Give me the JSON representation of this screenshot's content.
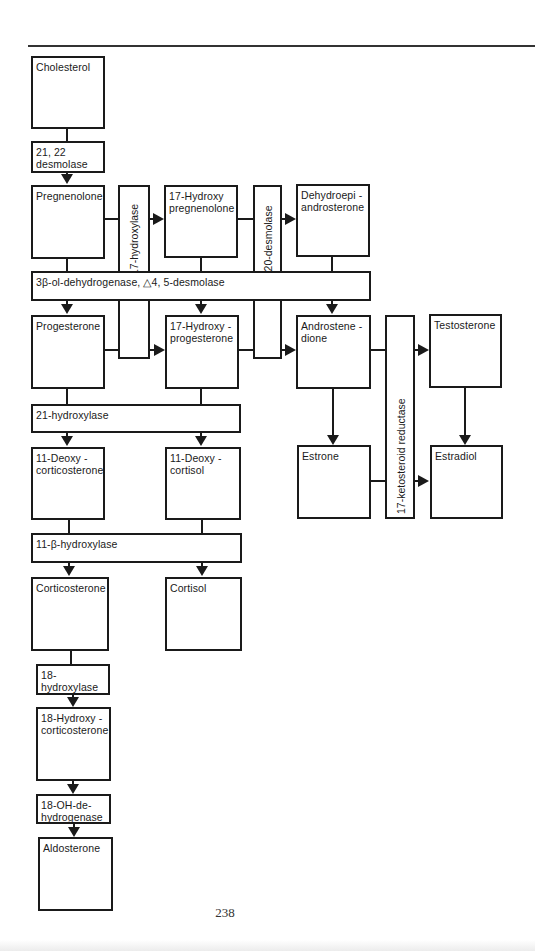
{
  "diagram": {
    "compounds": {
      "cholesterol": "Cholesterol",
      "pregnenolone": "Pregnenolone",
      "hydroxy_pregnenolone": "17-Hydroxy pregnenolone",
      "dhea": "Dehydroepi - androsterone",
      "progesterone": "Progesterone",
      "hydroxy_progesterone": "17-Hydroxy - progesterone",
      "androstenedione": "Androstene - dione",
      "testosterone": "Testosterone",
      "deoxycorticosterone": "11-Deoxy - corticosterone",
      "deoxycortisol": "11-Deoxy - cortisol",
      "estrone": "Estrone",
      "estradiol": "Estradiol",
      "corticosterone": "Corticosterone",
      "cortisol": "Cortisol",
      "hydroxycorticosterone": "18-Hydroxy - corticosterone",
      "aldosterone": "Aldosterone"
    },
    "enzymes": {
      "desmolase_2122": "21, 22 desmolase",
      "hydroxylase_17": "17-hydroxylase",
      "desmolase_1720": "17,20-desmolase",
      "dehydrogenase_3b": "3β-ol-dehydrogenase, △4, 5-desmolase",
      "ketosteroid_reductase_17": "17-ketosteroid reductase",
      "hydroxylase_21": "21-hydroxylase",
      "hydroxylase_11b": "11-β-hydroxylase",
      "hydroxylase_18": "18- hydroxylase",
      "oh_dehydrogenase_18": "18-OH-de- hydrogenase"
    },
    "edges": [
      [
        "Cholesterol",
        "Pregnenolone",
        "21, 22 desmolase"
      ],
      [
        "Pregnenolone",
        "17-Hydroxy pregnenolone",
        "17-hydroxylase"
      ],
      [
        "17-Hydroxy pregnenolone",
        "Dehydroepiandrosterone",
        "17,20-desmolase"
      ],
      [
        "Pregnenolone",
        "Progesterone",
        "3β-ol-dehydrogenase"
      ],
      [
        "17-Hydroxy pregnenolone",
        "17-Hydroxyprogesterone",
        "3β-ol-dehydrogenase"
      ],
      [
        "Dehydroepiandrosterone",
        "Androstenedione",
        "3β-ol-dehydrogenase"
      ],
      [
        "Progesterone",
        "17-Hydroxyprogesterone",
        "17-hydroxylase"
      ],
      [
        "17-Hydroxyprogesterone",
        "Androstenedione",
        "17,20-desmolase"
      ],
      [
        "Androstenedione",
        "Testosterone",
        "17-ketosteroid reductase"
      ],
      [
        "Androstenedione",
        "Estrone",
        ""
      ],
      [
        "Testosterone",
        "Estradiol",
        ""
      ],
      [
        "Estrone",
        "Estradiol",
        "17-ketosteroid reductase"
      ],
      [
        "Progesterone",
        "11-Deoxycorticosterone",
        "21-hydroxylase"
      ],
      [
        "17-Hydroxyprogesterone",
        "11-Deoxycortisol",
        "21-hydroxylase"
      ],
      [
        "11-Deoxycorticosterone",
        "Corticosterone",
        "11-β-hydroxylase"
      ],
      [
        "11-Deoxycortisol",
        "Cortisol",
        "11-β-hydroxylase"
      ],
      [
        "Corticosterone",
        "18-Hydroxycorticosterone",
        "18-hydroxylase"
      ],
      [
        "18-Hydroxycorticosterone",
        "Aldosterone",
        "18-OH-dehydrogenase"
      ]
    ]
  },
  "page": {
    "number": "238"
  }
}
